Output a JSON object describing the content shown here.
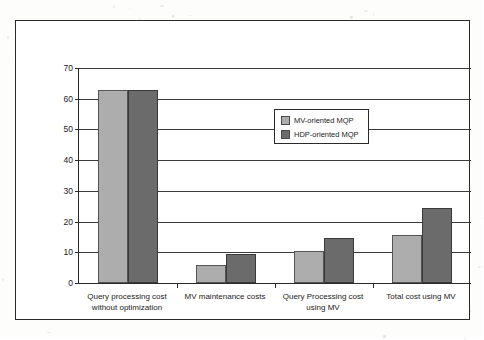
{
  "chart_data": {
    "type": "bar",
    "title": "",
    "xlabel": "",
    "ylabel": "Execution time (millions of Milliseconds).",
    "ylim": [
      0,
      70
    ],
    "ytick_labels": [
      "0",
      "10",
      "20",
      "30",
      "40",
      "50",
      "60",
      "70"
    ],
    "ytick_values": [
      0,
      10,
      20,
      30,
      40,
      50,
      60,
      70
    ],
    "grid": true,
    "legend_position": "inside-upper-right",
    "categories": [
      "Query processing cost without optimization",
      "MV maintenance costs",
      "Query Processing cost using MV",
      "Total cost using MV"
    ],
    "series": [
      {
        "name": "MV-oriented MQP",
        "color": "#adadad",
        "values": [
          63,
          6,
          10.3,
          15.7
        ]
      },
      {
        "name": "HDP-oriented MQP",
        "color": "#6b6b6b",
        "values": [
          63,
          9.5,
          14.7,
          24.5
        ]
      }
    ]
  },
  "legend": {
    "items": [
      {
        "label": "MV-oriented MQP"
      },
      {
        "label": "HDP-oriented MQP"
      }
    ]
  },
  "colors": {
    "series_light": "#adadad",
    "series_dark": "#6b6b6b",
    "axis": "#2a2a2a",
    "background": "#ffffff"
  }
}
